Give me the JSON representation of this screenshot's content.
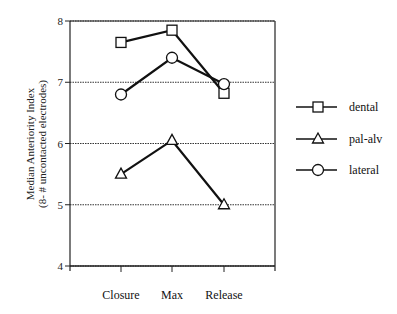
{
  "chart_data": {
    "type": "line",
    "title": "",
    "xlabel": "",
    "ylabel": "Median Anteriority Index\n(8- # uncontacted electrodes)",
    "ylabel_lines": [
      "Median Anteriority Index",
      "(8- # uncontacted electrodes)"
    ],
    "categories": [
      "Closure",
      "Max",
      "Release"
    ],
    "ylim": [
      4,
      8
    ],
    "yticks": [
      "4",
      "5",
      "6",
      "7",
      "8"
    ],
    "grid": "horizontal dotted",
    "legend_position": "right",
    "series": [
      {
        "name": "dental",
        "marker": "square",
        "values": [
          7.65,
          7.85,
          6.82
        ]
      },
      {
        "name": "pal-alv",
        "marker": "triangle",
        "values": [
          5.5,
          6.05,
          5.0
        ]
      },
      {
        "name": "lateral",
        "marker": "circle",
        "values": [
          6.8,
          7.4,
          6.97
        ]
      }
    ]
  },
  "legend": {
    "items": [
      {
        "label": "dental"
      },
      {
        "label": "pal-alv"
      },
      {
        "label": "lateral"
      }
    ]
  }
}
